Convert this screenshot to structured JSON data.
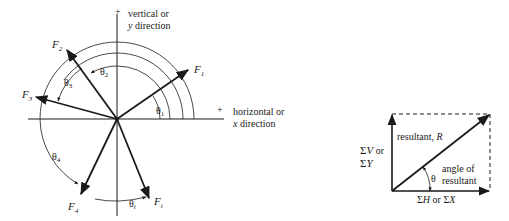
{
  "left_diagram": {
    "axis_labels": {
      "vertical_plus": "+",
      "vertical_line1": "vertical or",
      "vertical_line2_var": "y",
      "vertical_line2_rest": " direction",
      "horizontal_plus": "+",
      "horizontal_line1": "horizontal or",
      "horizontal_line2_var": "x",
      "horizontal_line2_rest": " direction"
    },
    "forces": [
      {
        "name": "F",
        "sub": "1"
      },
      {
        "name": "F",
        "sub": "2"
      },
      {
        "name": "F",
        "sub": "3"
      },
      {
        "name": "F",
        "sub": "4"
      },
      {
        "name": "F",
        "sub": "i"
      }
    ],
    "angles": [
      {
        "name": "θ",
        "sub": "1"
      },
      {
        "name": "θ",
        "sub": "2"
      },
      {
        "name": "θ",
        "sub": "3"
      },
      {
        "name": "θ",
        "sub": "4"
      },
      {
        "name": "θ",
        "sub": "i"
      }
    ]
  },
  "right_diagram": {
    "resultant_label_text": "resultant, ",
    "resultant_label_var": "R",
    "vertical_sum_line1_sym": "Σ",
    "vertical_sum_line1_var": "V",
    "vertical_sum_line1_rest": " or",
    "vertical_sum_line2_sym": "Σ",
    "vertical_sum_line2_var": "Y",
    "angle_symbol": "θ",
    "angle_label_line1": "angle of",
    "angle_label_line2": "resultant",
    "horizontal_sum_sym1": "Σ",
    "horizontal_sum_var1": "H",
    "horizontal_sum_or": " or ",
    "horizontal_sum_sym2": "Σ",
    "horizontal_sum_var2": "X"
  },
  "colors": {
    "ink": "#1a1a1a",
    "background": "#ffffff"
  }
}
